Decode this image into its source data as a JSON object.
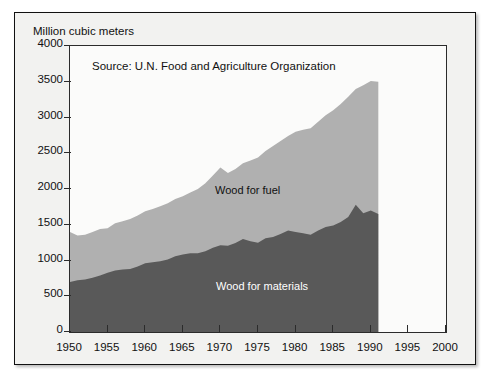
{
  "chart_data": {
    "type": "area",
    "stacked": true,
    "title": "",
    "ylabel": "Million cubic meters",
    "xlabel": "",
    "source_note": "Source: U.N. Food and Agriculture Organization",
    "xlim": [
      1950,
      2000
    ],
    "ylim": [
      0,
      4000
    ],
    "xticks": [
      1950,
      1955,
      1960,
      1965,
      1970,
      1975,
      1980,
      1985,
      1990,
      1995,
      2000
    ],
    "yticks": [
      0,
      500,
      1000,
      1500,
      2000,
      2500,
      3000,
      3500,
      4000
    ],
    "grid": false,
    "legend_position": "inline-annotation",
    "data_end_year": 1991,
    "colors": {
      "wood_for_materials": "#595959",
      "wood_for_fuel": "#b0b0b0",
      "axis": "#2b2b2b",
      "frame": "#111111",
      "background": "#f2f2f0",
      "plot_background": "#fbfbfa"
    },
    "x": [
      1950,
      1951,
      1952,
      1953,
      1954,
      1955,
      1956,
      1957,
      1958,
      1959,
      1960,
      1961,
      1962,
      1963,
      1964,
      1965,
      1966,
      1967,
      1968,
      1969,
      1970,
      1971,
      1972,
      1973,
      1974,
      1975,
      1976,
      1977,
      1978,
      1979,
      1980,
      1981,
      1982,
      1983,
      1984,
      1985,
      1986,
      1987,
      1988,
      1989,
      1990,
      1991
    ],
    "series": [
      {
        "name": "Wood for materials",
        "label": "Wood for materials",
        "color": "#595959",
        "values": [
          700,
          725,
          735,
          760,
          790,
          830,
          860,
          875,
          880,
          915,
          960,
          975,
          990,
          1015,
          1060,
          1085,
          1100,
          1100,
          1130,
          1180,
          1215,
          1205,
          1245,
          1300,
          1270,
          1250,
          1310,
          1330,
          1370,
          1420,
          1400,
          1380,
          1360,
          1420,
          1470,
          1490,
          1540,
          1610,
          1780,
          1660,
          1700,
          1650
        ]
      },
      {
        "name": "Wood for fuel",
        "label": "Wood for fuel",
        "color": "#b0b0b0",
        "values": [
          700,
          625,
          625,
          640,
          650,
          620,
          660,
          675,
          700,
          715,
          730,
          745,
          770,
          785,
          800,
          815,
          850,
          900,
          950,
          1010,
          1085,
          1020,
          1035,
          1060,
          1130,
          1190,
          1220,
          1270,
          1300,
          1320,
          1400,
          1450,
          1490,
          1520,
          1560,
          1610,
          1650,
          1680,
          1620,
          1790,
          1810,
          1850
        ]
      }
    ],
    "totals": [
      1400,
      1350,
      1360,
      1400,
      1440,
      1450,
      1520,
      1550,
      1580,
      1630,
      1690,
      1720,
      1760,
      1800,
      1860,
      1900,
      1950,
      2000,
      2080,
      2190,
      2300,
      2225,
      2280,
      2360,
      2400,
      2440,
      2530,
      2600,
      2670,
      2740,
      2800,
      2830,
      2850,
      2940,
      3030,
      3100,
      3190,
      3290,
      3400,
      3450,
      3510,
      3500
    ]
  },
  "labels": {
    "ylabel": "Million cubic meters",
    "source": "Source: U.N. Food and Agriculture Organization",
    "series_fuel": "Wood for fuel",
    "series_materials": "Wood for materials"
  }
}
